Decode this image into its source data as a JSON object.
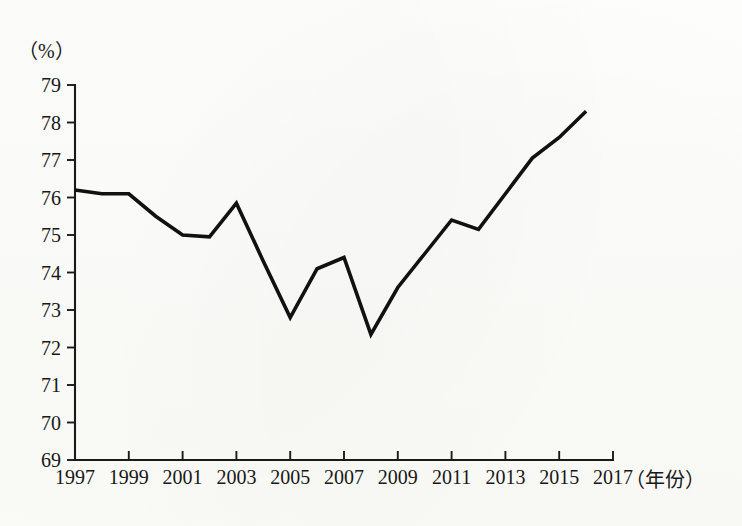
{
  "chart_data": {
    "type": "line",
    "title": "",
    "subtitle": "",
    "xlabel": "（年份）",
    "ylabel": "（%）",
    "x": [
      1997,
      1998,
      1999,
      2000,
      2001,
      2002,
      2003,
      2004,
      2005,
      2006,
      2007,
      2008,
      2009,
      2010,
      2011,
      2012,
      2013,
      2014,
      2015,
      2016
    ],
    "values": [
      76.2,
      76.1,
      76.1,
      75.5,
      75.0,
      74.95,
      75.85,
      74.3,
      72.8,
      74.1,
      74.4,
      72.35,
      73.6,
      74.5,
      75.4,
      75.15,
      76.1,
      77.05,
      77.6,
      78.3
    ],
    "series": [
      {
        "name": "",
        "values": [
          76.2,
          76.1,
          76.1,
          75.5,
          75.0,
          74.95,
          75.85,
          74.3,
          72.8,
          74.1,
          74.4,
          72.35,
          73.6,
          74.5,
          75.4,
          75.15,
          76.1,
          77.05,
          77.6,
          78.3
        ]
      }
    ],
    "xlim": [
      1997,
      2017
    ],
    "ylim": [
      69,
      79
    ],
    "x_tick_labels": [
      "1997",
      "1999",
      "2001",
      "2003",
      "2005",
      "2007",
      "2009",
      "2011",
      "2013",
      "2015",
      "2017"
    ],
    "x_tick_values": [
      1997,
      1999,
      2001,
      2003,
      2005,
      2007,
      2009,
      2011,
      2013,
      2015,
      2017
    ],
    "y_tick_labels": [
      "69",
      "70",
      "71",
      "72",
      "73",
      "74",
      "75",
      "76",
      "77",
      "78",
      "79"
    ],
    "y_tick_values": [
      69,
      70,
      71,
      72,
      73,
      74,
      75,
      76,
      77,
      78,
      79
    ],
    "grid": false,
    "legend": false,
    "legend_position": "none",
    "line_color": "#111111",
    "axis_color": "#1a1a1a",
    "background_color": "#fdfdfb"
  },
  "labels": {
    "y_axis_unit": "（%）",
    "x_axis_unit": "（年份）"
  }
}
